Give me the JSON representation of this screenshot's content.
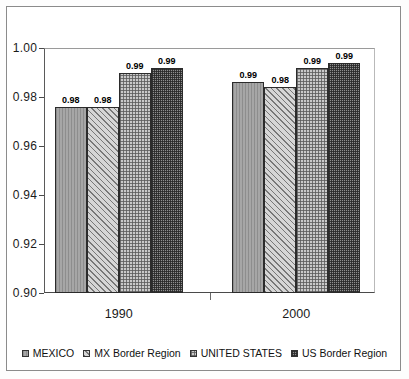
{
  "chart_data": {
    "type": "bar",
    "title": "",
    "subtitle": "",
    "xlabel": "",
    "ylabel": "",
    "categories": [
      "1990",
      "2000"
    ],
    "ylim": [
      0.9,
      1.0
    ],
    "yticks": [
      "0.90",
      "0.92",
      "0.94",
      "0.96",
      "0.98",
      "1.00"
    ],
    "ytick_values": [
      0.9,
      0.92,
      0.94,
      0.96,
      0.98,
      1.0
    ],
    "grid": false,
    "legend_position": "bottom",
    "series": [
      {
        "name": "MEXICO",
        "pattern": "vertical-lines",
        "color": "#a6a6a6",
        "values": [
          0.976,
          0.986
        ],
        "labels": [
          "0.98",
          "0.99"
        ]
      },
      {
        "name": "MX Border Region",
        "pattern": "diagonal-stripes",
        "color": "#a4a4a4",
        "values": [
          0.976,
          0.984
        ],
        "labels": [
          "0.98",
          "0.98"
        ]
      },
      {
        "name": "UNITED STATES",
        "pattern": "light-crosshatch",
        "color": "#c9c9c9",
        "values": [
          0.99,
          0.992
        ],
        "labels": [
          "0.99",
          "0.99"
        ]
      },
      {
        "name": "US Border Region",
        "pattern": "dense-crosshatch",
        "color": "#8f8f8f",
        "values": [
          0.992,
          0.994
        ],
        "labels": [
          "0.99",
          "0.99"
        ]
      }
    ]
  },
  "legend": {
    "items": [
      {
        "label": "MEXICO"
      },
      {
        "label": "MX Border Region"
      },
      {
        "label": "UNITED STATES"
      },
      {
        "label": "US Border Region"
      }
    ]
  }
}
